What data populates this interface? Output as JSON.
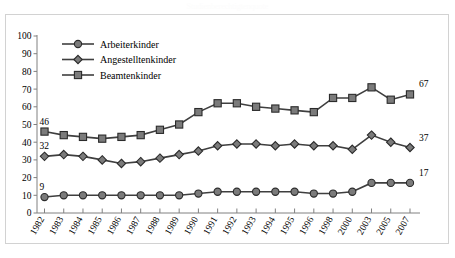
{
  "top_title": "Studienberechtigtenquote",
  "frame": {
    "border_color": "#d2d2d2",
    "background": "#ffffff"
  },
  "chart_data": {
    "type": "line",
    "title": "",
    "xlabel": "",
    "ylabel": "",
    "ylim": [
      0,
      100
    ],
    "ytick_step": 10,
    "grid": false,
    "legend_position": "top-left-inside",
    "axis_color": "#808080",
    "line_color": "#3f3f3f",
    "marker_fill": "#7b7b7b",
    "categories": [
      "1982",
      "1983",
      "1984",
      "1985",
      "1986",
      "1987",
      "1988",
      "1989",
      "1990",
      "1991",
      "1992",
      "1993",
      "1994",
      "1995",
      "1996",
      "1998",
      "2000",
      "2003",
      "2005",
      "2007"
    ],
    "yticks": [
      0,
      10,
      20,
      30,
      40,
      50,
      60,
      70,
      80,
      90,
      100
    ],
    "series": [
      {
        "name": "Arbeiterkinder",
        "marker": "circle",
        "values": [
          9,
          10,
          10,
          10,
          10,
          10,
          10,
          10,
          11,
          12,
          12,
          12,
          12,
          12,
          11,
          11,
          12,
          17,
          17,
          17
        ],
        "start_label": "9",
        "end_label": "17"
      },
      {
        "name": "Angestelltenkinder",
        "marker": "diamond",
        "values": [
          32,
          33,
          32,
          30,
          28,
          29,
          31,
          33,
          35,
          38,
          39,
          39,
          38,
          39,
          38,
          38,
          36,
          44,
          40,
          37
        ],
        "start_label": "32",
        "end_label": "37"
      },
      {
        "name": "Beamtenkinder",
        "marker": "square",
        "values": [
          46,
          44,
          43,
          42,
          43,
          44,
          47,
          50,
          57,
          62,
          62,
          60,
          59,
          58,
          57,
          65,
          65,
          71,
          64,
          67
        ],
        "start_label": "46",
        "end_label": "67"
      }
    ],
    "endpoint_labels": {
      "start": [
        "46",
        "32",
        "9"
      ],
      "end": [
        "67",
        "37",
        "17"
      ]
    }
  }
}
